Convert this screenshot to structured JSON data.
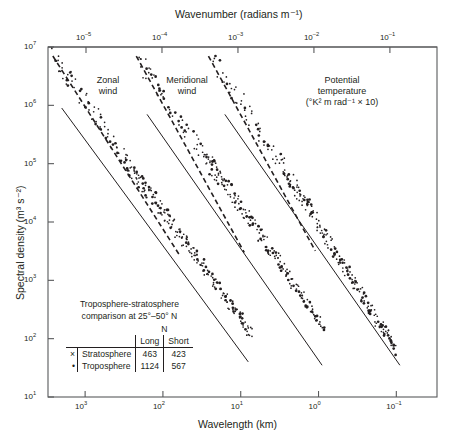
{
  "chart_data": {
    "type": "scatter",
    "title": "",
    "xlabel": "Wavelength (km)",
    "ylabel": "Spectral density (m³ s⁻²)",
    "top_axis_label": "Wavenumber (radians m⁻¹)",
    "x_scale": "log",
    "y_scale": "log",
    "x_reversed": true,
    "xlim": [
      3000,
      0.03
    ],
    "ylim": [
      10,
      10000000
    ],
    "grid": false,
    "legend_position": "inside-lower-left",
    "x_ticks": [
      {
        "value": 1000,
        "label_mantissa": "10",
        "label_exp": "3"
      },
      {
        "value": 100,
        "label_mantissa": "10",
        "label_exp": "2"
      },
      {
        "value": 10,
        "label_mantissa": "10",
        "label_exp": "1"
      },
      {
        "value": 1,
        "label_mantissa": "10",
        "label_exp": "0"
      },
      {
        "value": 0.1,
        "label_mantissa": "10",
        "label_exp": "–1"
      }
    ],
    "top_ticks": [
      {
        "label_mantissa": "10",
        "label_exp": "–5"
      },
      {
        "label_mantissa": "10",
        "label_exp": "–4"
      },
      {
        "label_mantissa": "10",
        "label_exp": "–3"
      },
      {
        "label_mantissa": "10",
        "label_exp": "–2"
      },
      {
        "label_mantissa": "10",
        "label_exp": "–1"
      }
    ],
    "y_ticks": [
      {
        "value": 10000000,
        "label_mantissa": "10",
        "label_exp": "7"
      },
      {
        "value": 1000000,
        "label_mantissa": "10",
        "label_exp": "6"
      },
      {
        "value": 100000,
        "label_mantissa": "10",
        "label_exp": "5"
      },
      {
        "value": 10000,
        "label_mantissa": "10",
        "label_exp": "4"
      },
      {
        "value": 1000,
        "label_mantissa": "10",
        "label_exp": "3"
      },
      {
        "value": 100,
        "label_mantissa": "10",
        "label_exp": "2"
      },
      {
        "value": 10,
        "label_mantissa": "10",
        "label_exp": "1"
      }
    ],
    "annotations": [
      {
        "name": "zonal-wind",
        "line1": "Zonal",
        "line2": "wind",
        "line3": ""
      },
      {
        "name": "meridional-wind",
        "line1": "Meridional",
        "line2": "wind",
        "line3": ""
      },
      {
        "name": "potential-temperature",
        "line1": "Potential",
        "line2": "temperature",
        "line3": "(°K² m rad⁻¹ × 10)"
      }
    ],
    "series": [
      {
        "name": "Zonal wind",
        "marker": "dot",
        "reference_line": {
          "style": "solid",
          "slope": -1.667,
          "x0": 2000,
          "y0": 900000,
          "x1": 8,
          "y1": 40
        },
        "dashed_line": {
          "style": "dashed",
          "slope": -1.667,
          "x0": 2600,
          "y0": 7000000,
          "x1": 60,
          "y1": 2600
        },
        "points_x": [
          2600,
          2400,
          2300,
          2100,
          1900,
          1750,
          1600,
          1500,
          1380,
          1300,
          1180,
          1100,
          1000,
          940,
          880,
          820,
          760,
          700,
          660,
          610,
          570,
          530,
          490,
          460,
          430,
          400,
          370,
          345,
          320,
          300,
          280,
          260,
          242,
          226,
          210,
          196,
          182,
          170,
          158,
          148,
          138,
          128,
          120,
          112,
          104,
          97,
          90,
          84,
          78,
          73,
          68,
          63,
          59,
          55,
          51,
          48,
          44,
          41,
          38,
          36,
          33,
          31,
          29,
          27,
          25,
          23,
          22,
          20,
          19,
          17.5,
          16.3,
          15.2,
          14.1,
          13.2,
          12.3,
          11.4,
          10.6,
          9.9,
          9.2,
          8.6,
          8.0,
          7.4
        ],
        "points_y": [
          6800000,
          6000000,
          5400000,
          4600000,
          3900000,
          3300000,
          2800000,
          2500000,
          2100000,
          1900000,
          1600000,
          1400000,
          1200000,
          1050000,
          920000,
          820000,
          700000,
          620000,
          540000,
          470000,
          410000,
          350000,
          300000,
          265000,
          230000,
          200000,
          170000,
          150000,
          130000,
          115000,
          100000,
          88000,
          77000,
          68000,
          59000,
          52000,
          45000,
          40000,
          35000,
          31000,
          27000,
          24000,
          21000,
          18500,
          16200,
          14200,
          12500,
          11000,
          9600,
          8500,
          7400,
          6500,
          5700,
          5000,
          4400,
          3900,
          3400,
          3000,
          2600,
          2300,
          2000,
          1750,
          1550,
          1350,
          1180,
          1040,
          910,
          800,
          700,
          610,
          540,
          470,
          410,
          360,
          315,
          275,
          240,
          210,
          185,
          162,
          142,
          124
        ]
      },
      {
        "name": "Meridional wind",
        "marker": "dot",
        "reference_line": {
          "style": "solid",
          "slope": -1.667,
          "x0": 160,
          "y0": 700000,
          "x1": 0.9,
          "y1": 35
        },
        "dashed_line": {
          "style": "dashed",
          "slope": -1.667,
          "x0": 220,
          "y0": 7000000,
          "x1": 9,
          "y1": 3000
        },
        "points_x": [
          200,
          185,
          172,
          160,
          148,
          138,
          128,
          119,
          110,
          102,
          95,
          88,
          82,
          76,
          70,
          65,
          60,
          56,
          52,
          48,
          45,
          41,
          38,
          36,
          33,
          31,
          28,
          26,
          24,
          22.5,
          21,
          19.5,
          18,
          16.7,
          15.5,
          14.4,
          13.3,
          12.4,
          11.5,
          10.6,
          9.9,
          9.1,
          8.5,
          7.8,
          7.3,
          6.7,
          6.2,
          5.8,
          5.4,
          5.0,
          4.6,
          4.3,
          4.0,
          3.7,
          3.4,
          3.2,
          2.9,
          2.7,
          2.5,
          2.3,
          2.2,
          2.0,
          1.85,
          1.72,
          1.6,
          1.48,
          1.37,
          1.27,
          1.18,
          1.1,
          1.02,
          0.95,
          0.88
        ],
        "points_y": [
          5600000,
          4900000,
          4300000,
          3700000,
          3200000,
          2800000,
          2400000,
          2100000,
          1800000,
          1550000,
          1350000,
          1150000,
          1000000,
          870000,
          740000,
          640000,
          550000,
          480000,
          415000,
          355000,
          310000,
          265000,
          228000,
          200000,
          170000,
          148000,
          125000,
          108000,
          93000,
          82000,
          72000,
          63000,
          55000,
          48000,
          42000,
          36500,
          31500,
          27500,
          24000,
          20500,
          17800,
          15300,
          13400,
          11500,
          10000,
          8600,
          7400,
          6400,
          5600,
          4800,
          4100,
          3600,
          3100,
          2700,
          2300,
          2000,
          1700,
          1480,
          1270,
          1090,
          950,
          810,
          700,
          610,
          530,
          455,
          395,
          345,
          300,
          260,
          226,
          197,
          170
        ]
      },
      {
        "name": "Potential temperature",
        "marker": "dot",
        "reference_line": {
          "style": "solid",
          "slope": -1.667,
          "x0": 16,
          "y0": 700000,
          "x1": 0.09,
          "y1": 35
        },
        "dashed_line": {
          "style": "dashed",
          "slope": -1.667,
          "x0": 26,
          "y0": 7000000,
          "x1": 1.1,
          "y1": 3200
        },
        "points_x": [
          22,
          20,
          18.5,
          17.2,
          16,
          14.8,
          13.7,
          12.7,
          11.8,
          11.0,
          10.2,
          9.4,
          8.7,
          8.1,
          7.5,
          7.0,
          6.5,
          6.0,
          5.6,
          5.2,
          4.8,
          4.5,
          4.1,
          3.8,
          3.6,
          3.3,
          3.1,
          2.85,
          2.65,
          2.45,
          2.28,
          2.1,
          1.95,
          1.82,
          1.69,
          1.57,
          1.45,
          1.35,
          1.26,
          1.17,
          1.08,
          1.0,
          0.93,
          0.87,
          0.8,
          0.75,
          0.69,
          0.64,
          0.6,
          0.55,
          0.51,
          0.48,
          0.44,
          0.41,
          0.38,
          0.35,
          0.33,
          0.3,
          0.28,
          0.26,
          0.24,
          0.22,
          0.21,
          0.19,
          0.18,
          0.165,
          0.153,
          0.142,
          0.131,
          0.122,
          0.113,
          0.105
        ],
        "points_y": [
          5200000,
          4500000,
          3900000,
          3400000,
          2950000,
          2550000,
          2200000,
          1900000,
          1650000,
          1420000,
          1220000,
          1050000,
          900000,
          775000,
          665000,
          570000,
          490000,
          420000,
          360000,
          308000,
          264000,
          226000,
          193000,
          165000,
          141000,
          121000,
          103000,
          88000,
          75000,
          64000,
          54500,
          46500,
          39500,
          33700,
          28700,
          24400,
          20800,
          17700,
          15000,
          12800,
          10900,
          9250,
          7850,
          6680,
          5670,
          4820,
          4090,
          3470,
          2950,
          2500,
          2120,
          1800,
          1530,
          1300,
          1100,
          935,
          793,
          673,
          571,
          485,
          411,
          349,
          296,
          251,
          213,
          181,
          153,
          130,
          110,
          93,
          79,
          67
        ]
      }
    ]
  },
  "legend": {
    "title_line1": "Troposphere-stratosphere",
    "title_line2": "comparison at 25°–50° N",
    "n_header": "N",
    "col_long": "Long",
    "col_short": "Short",
    "rows": [
      {
        "marker": "×",
        "label": "Stratosphere",
        "long": "463",
        "short": "423"
      },
      {
        "marker": "•",
        "label": "Troposphere",
        "long": "1124",
        "short": "567"
      }
    ]
  }
}
